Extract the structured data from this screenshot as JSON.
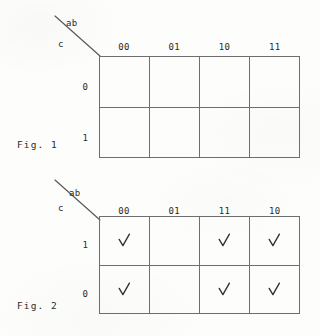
{
  "page": {
    "background_color": "#fdfdfb",
    "ink_color": "#2b2b2b",
    "grid_line_color": "#6e6e6e"
  },
  "figures": [
    {
      "caption": "Fig. 1",
      "row_variable": "c",
      "col_variable": "ab",
      "col_headers": [
        "00",
        "01",
        "10",
        "11"
      ],
      "row_headers": [
        "0",
        "1"
      ],
      "cells": [
        [
          "",
          "",
          "",
          ""
        ],
        [
          "",
          "",
          "",
          ""
        ]
      ]
    },
    {
      "caption": "Fig. 2",
      "row_variable": "c",
      "col_variable": "ab",
      "col_headers": [
        "00",
        "01",
        "11",
        "10"
      ],
      "row_headers": [
        "1",
        "0"
      ],
      "cells": [
        [
          "check",
          "",
          "check",
          "check"
        ],
        [
          "check",
          "",
          "check",
          "check"
        ]
      ]
    }
  ]
}
